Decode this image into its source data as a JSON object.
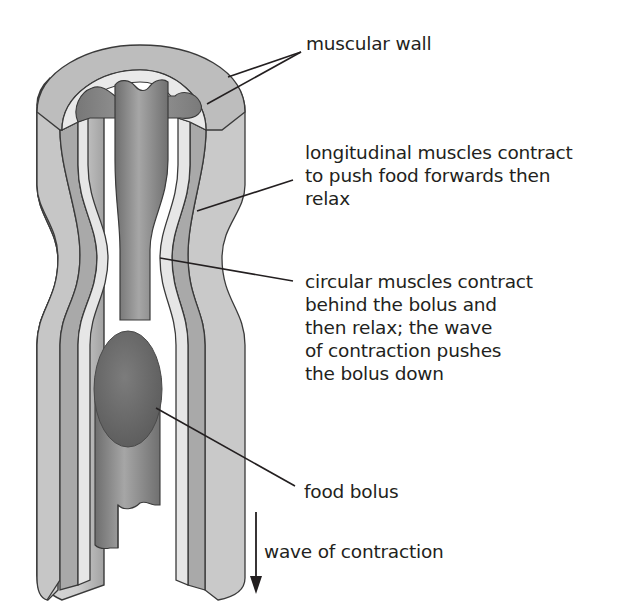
{
  "diagram": {
    "colors": {
      "outer_wall": "#c2c2c2",
      "outer_wall_shade": "#9c9c9c",
      "longitudinal_layer": "#a9a9a9",
      "circular_layer": "#e4e4e4",
      "lumen_tissue": "#8f8f8f",
      "bolus": "#6f6f6f",
      "outline": "#3a3a3a",
      "text": "#231f20"
    },
    "labels": {
      "muscular_wall": {
        "lines": [
          "muscular wall"
        ]
      },
      "longitudinal": {
        "lines": [
          "longitudinal muscles contract",
          "to push food forwards then",
          "relax"
        ]
      },
      "circular": {
        "lines": [
          "circular muscles contract",
          "behind the bolus and",
          "then relax; the wave",
          "of contraction pushes",
          "the bolus down"
        ]
      },
      "bolus": {
        "lines": [
          "food bolus"
        ]
      },
      "wave": {
        "lines": [
          "wave of contraction"
        ],
        "arrow_direction": "down"
      }
    }
  }
}
